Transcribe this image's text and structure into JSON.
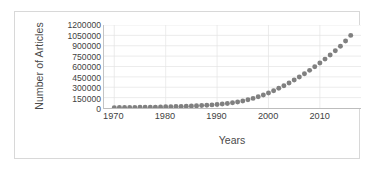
{
  "chart_data": {
    "type": "scatter",
    "title": "",
    "xlabel": "Years",
    "ylabel": "Number of Articles",
    "xlim": [
      1968,
      2018
    ],
    "ylim": [
      0,
      1200000
    ],
    "grid": true,
    "legend": "none",
    "marker": {
      "shape": "circle",
      "color": "#808080",
      "size_px": 5
    },
    "yticks": [
      0,
      150000,
      300000,
      450000,
      600000,
      750000,
      900000,
      1050000,
      1200000
    ],
    "ytick_labels": [
      "0",
      "150000",
      "300000",
      "450000",
      "600000",
      "750000",
      "900000",
      "1050000",
      "1200000"
    ],
    "xticks": [
      1970,
      1980,
      1990,
      2000,
      2010
    ],
    "xtick_labels": [
      "1970",
      "1980",
      "1990",
      "2000",
      "2010"
    ],
    "x": [
      1970,
      1971,
      1972,
      1973,
      1974,
      1975,
      1976,
      1977,
      1978,
      1979,
      1980,
      1981,
      1982,
      1983,
      1984,
      1985,
      1986,
      1987,
      1988,
      1989,
      1990,
      1991,
      1992,
      1993,
      1994,
      1995,
      1996,
      1997,
      1998,
      1999,
      2000,
      2001,
      2002,
      2003,
      2004,
      2005,
      2006,
      2007,
      2008,
      2009,
      2010,
      2011,
      2012,
      2013,
      2014,
      2015,
      2016
    ],
    "values": [
      5000,
      6000,
      7000,
      8000,
      9000,
      10000,
      11000,
      12000,
      13000,
      15000,
      17000,
      19000,
      21000,
      23000,
      26000,
      29000,
      32000,
      36000,
      40000,
      45000,
      51000,
      58000,
      66000,
      76000,
      88000,
      102000,
      119000,
      139000,
      162000,
      188000,
      218000,
      250000,
      285000,
      322000,
      362000,
      404000,
      448000,
      495000,
      544000,
      596000,
      650000,
      707000,
      766000,
      828000,
      892000,
      968000,
      1050000
    ]
  },
  "axes": {
    "ylabel_text": "Number of Articles",
    "xlabel_text": "Years"
  }
}
